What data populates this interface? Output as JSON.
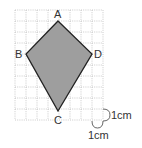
{
  "figure": {
    "type": "kite-on-grid",
    "grid": {
      "cols": 8,
      "rows": 10,
      "cell_px": 11,
      "origin": [
        15,
        10
      ],
      "line_color": "#bdbdbd"
    },
    "shape": {
      "fill": "#9e9e9e",
      "stroke": "#222222",
      "vertices": {
        "A": [
          58,
          21
        ],
        "B": [
          26,
          54
        ],
        "C": [
          58,
          111
        ],
        "D": [
          92,
          54
        ]
      }
    },
    "labels": {
      "A": "A",
      "B": "B",
      "C": "C",
      "D": "D"
    },
    "scale": {
      "horizontal": "1cm",
      "vertical": "1cm"
    }
  }
}
